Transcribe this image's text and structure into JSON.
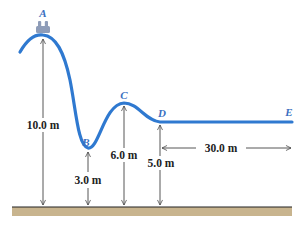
{
  "diagram": {
    "type": "roller-coaster-track",
    "colors": {
      "track": "#2f79d0",
      "labels": "#3a6fc0",
      "dimension_lines": "#444444",
      "ground_fill": "#c8b48e",
      "ground_line": "#222222",
      "cart": "#8e9cb8"
    },
    "points": [
      {
        "id": "A",
        "label": "A"
      },
      {
        "id": "B",
        "label": "B"
      },
      {
        "id": "C",
        "label": "C"
      },
      {
        "id": "D",
        "label": "D"
      },
      {
        "id": "E",
        "label": "E"
      }
    ],
    "dimensions": {
      "height_A": "10.0 m",
      "height_B": "3.0 m",
      "height_C": "6.0 m",
      "height_D": "5.0 m",
      "distance_DE": "30.0 m"
    }
  }
}
